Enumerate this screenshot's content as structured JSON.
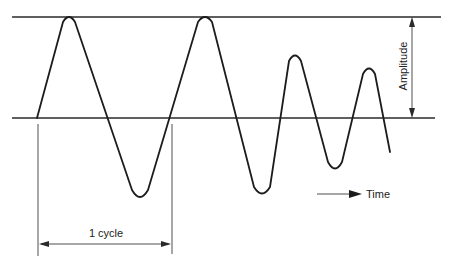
{
  "diagram": {
    "labels": {
      "amplitude": "Amplitude",
      "cycle": "1 cycle",
      "time": "Time"
    },
    "colors": {
      "line": "#1c1c1c",
      "background": "#ffffff"
    },
    "waveform": {
      "description": "Rounded triangular wave: two full-amplitude cycles followed by two decaying cycles",
      "peaks": [
        {
          "x": 69,
          "y": 17
        },
        {
          "x": 205,
          "y": 17
        },
        {
          "x": 295,
          "y": 56
        },
        {
          "x": 369,
          "y": 69
        }
      ],
      "troughs": [
        {
          "x": 140,
          "y": 198
        },
        {
          "x": 262,
          "y": 195
        },
        {
          "x": 335,
          "y": 170
        }
      ]
    }
  }
}
